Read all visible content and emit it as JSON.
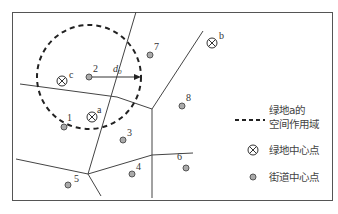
{
  "diagram": {
    "type": "voronoi-green-space-influence",
    "colors": {
      "line": "#444444",
      "frame": "#555555",
      "point_fill": "#aaaaaa",
      "text": "#333333"
    },
    "green_centers": [
      {
        "id": "a",
        "label": "a",
        "x": 92,
        "y": 117
      },
      {
        "id": "b",
        "label": "b",
        "x": 212,
        "y": 43
      },
      {
        "id": "c",
        "label": "c",
        "x": 62,
        "y": 80
      }
    ],
    "street_centers": [
      {
        "id": "1",
        "label": "1",
        "x": 64,
        "y": 126
      },
      {
        "id": "2",
        "label": "2",
        "x": 89,
        "y": 77
      },
      {
        "id": "3",
        "label": "3",
        "x": 123,
        "y": 140
      },
      {
        "id": "4",
        "label": "4",
        "x": 132,
        "y": 174
      },
      {
        "id": "5",
        "label": "5",
        "x": 68,
        "y": 185
      },
      {
        "id": "6",
        "label": "6",
        "x": 186,
        "y": 168
      },
      {
        "id": "7",
        "label": "7",
        "x": 150,
        "y": 55
      },
      {
        "id": "8",
        "label": "8",
        "x": 182,
        "y": 106
      }
    ],
    "radius_label": "d",
    "radius_subscript": "0",
    "legend": {
      "buffer_line1": "绿地a的",
      "buffer_line2": "空间作用域",
      "green_center": "绿地中心点",
      "street_center": "街道中心点"
    }
  }
}
